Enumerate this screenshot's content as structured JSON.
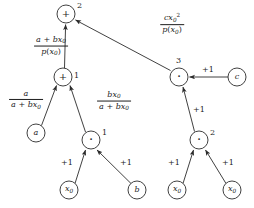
{
  "diagram": {
    "type": "dag",
    "stroke_color": "#2b2b2b",
    "background": "#ffffff"
  },
  "nodes": [
    {
      "id": "add2",
      "label": "+",
      "kind": "operator",
      "index": "2",
      "cx": 66,
      "cy": 14,
      "r": 9
    },
    {
      "id": "add1",
      "label": "+",
      "kind": "operator",
      "index": "1",
      "cx": 63,
      "cy": 77,
      "r": 9
    },
    {
      "id": "mul3",
      "label": "·",
      "kind": "operator",
      "index": "3",
      "cx": 179,
      "cy": 77,
      "r": 9
    },
    {
      "id": "mul1",
      "label": "·",
      "kind": "operator",
      "index": "1",
      "cx": 91,
      "cy": 140,
      "r": 9
    },
    {
      "id": "mul2",
      "label": "·",
      "kind": "operator",
      "index": "2",
      "cx": 199,
      "cy": 140,
      "r": 9
    },
    {
      "id": "a",
      "label": "a",
      "kind": "variable",
      "index": "",
      "cx": 36,
      "cy": 133,
      "r": 9
    },
    {
      "id": "c",
      "label": "c",
      "kind": "variable",
      "index": "",
      "cx": 237,
      "cy": 77,
      "r": 9
    },
    {
      "id": "x0_l",
      "label": "x0",
      "kind": "variable",
      "index": "",
      "cx": 69,
      "cy": 190,
      "r": 9
    },
    {
      "id": "b",
      "label": "b",
      "kind": "variable",
      "index": "",
      "cx": 137,
      "cy": 190,
      "r": 9
    },
    {
      "id": "x0_r1",
      "label": "x0",
      "kind": "variable",
      "index": "",
      "cx": 177,
      "cy": 190,
      "r": 9
    },
    {
      "id": "x0_r2",
      "label": "x0",
      "kind": "variable",
      "index": "",
      "cx": 232,
      "cy": 190,
      "r": 9
    }
  ],
  "edges": [
    {
      "id": "e_add1_add2",
      "from": "add1",
      "to": "add2",
      "label": "frac_a_plus_bx0_over_px0"
    },
    {
      "id": "e_mul3_add2",
      "from": "mul3",
      "to": "add2",
      "label": "frac_cx0sq_over_px0"
    },
    {
      "id": "e_a_add1",
      "from": "a",
      "to": "add1",
      "label": "frac_a_over_a_plus_bx0"
    },
    {
      "id": "e_mul1_add1",
      "from": "mul1",
      "to": "add1",
      "label": "frac_bx0_over_a_plus_bx0"
    },
    {
      "id": "e_c_mul3",
      "from": "c",
      "to": "mul3",
      "label": "plus_one"
    },
    {
      "id": "e_mul2_mul3",
      "from": "mul2",
      "to": "mul3",
      "label": "plus_one"
    },
    {
      "id": "e_x0l_mul1",
      "from": "x0_l",
      "to": "mul1",
      "label": "plus_one"
    },
    {
      "id": "e_b_mul1",
      "from": "b",
      "to": "mul1",
      "label": "plus_one"
    },
    {
      "id": "e_x0r1_mul2",
      "from": "x0_r1",
      "to": "mul2",
      "label": "plus_one"
    },
    {
      "id": "e_x0r2_mul2",
      "from": "x0_r2",
      "to": "mul2",
      "label": "plus_one"
    }
  ],
  "node_labels": {
    "add2": "+",
    "add1": "+",
    "mul3": "·",
    "mul1": "·",
    "mul2": "·",
    "a": "a",
    "c": "c",
    "b": "b",
    "x0": "x",
    "x0_sub": "0"
  },
  "node_indices": {
    "add2": "2",
    "add1": "1",
    "mul3": "3",
    "mul1": "1",
    "mul2": "2"
  },
  "edge_labels": {
    "plus_one": "+1",
    "frac_a_plus_bx0_over_px0": {
      "num_a": "a",
      "num_plus": "+",
      "num_b": "b",
      "num_x": "x",
      "num_x_sub": "0",
      "den_p": "p",
      "den_open": "(",
      "den_x": "x",
      "den_x_sub": "0",
      "den_close": ")"
    },
    "frac_cx0sq_over_px0": {
      "num_c": "c",
      "num_x": "x",
      "num_x_sub": "0",
      "num_x_sup": "2",
      "den_p": "p",
      "den_open": "(",
      "den_x": "x",
      "den_x_sub": "0",
      "den_close": ")"
    },
    "frac_a_over_a_plus_bx0": {
      "num_a": "a",
      "den_a": "a",
      "den_plus": "+",
      "den_b": "b",
      "den_x": "x",
      "den_x_sub": "0"
    },
    "frac_bx0_over_a_plus_bx0": {
      "num_b": "b",
      "num_x": "x",
      "num_x_sub": "0",
      "den_a": "a",
      "den_plus": "+",
      "den_b": "b",
      "den_x": "x",
      "den_x_sub": "0"
    }
  }
}
